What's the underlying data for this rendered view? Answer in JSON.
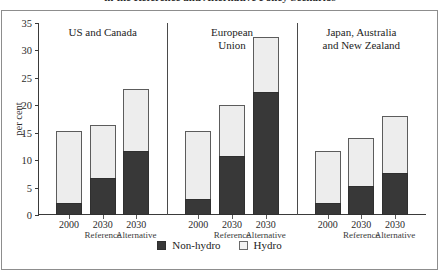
{
  "title": "in the Reference and Alternative Policy Scenarios",
  "axis": {
    "ylabel": "per cent",
    "yticks": [
      "0",
      "5",
      "10",
      "15",
      "20",
      "25",
      "30",
      "35"
    ],
    "ymin": 0,
    "ymax": 35
  },
  "legend": [
    {
      "label": "Non-hydro",
      "color": "#383838",
      "key": "nonhydro"
    },
    {
      "label": "Hydro",
      "color": "#f3f3f3",
      "key": "hydro"
    }
  ],
  "xticks": {
    "years": [
      "2000",
      "2030",
      "2030"
    ],
    "subs": [
      "",
      "Reference",
      "Alternative"
    ]
  },
  "chart_data": {
    "type": "bar",
    "title": "in the Reference and Alternative Policy Scenarios",
    "xlabel": "",
    "ylabel": "per cent",
    "ylim": [
      0,
      35
    ],
    "ytick_step": 5,
    "grid": false,
    "stacked": true,
    "legend_position": "bottom",
    "panels": [
      {
        "name": "US and Canada",
        "categories": [
          "2000",
          "2030 Reference",
          "2030 Alternative"
        ],
        "series": [
          {
            "name": "Non-hydro",
            "values": [
              2.2,
              6.8,
              11.6
            ]
          },
          {
            "name": "Hydro",
            "values": [
              13.1,
              9.6,
              11.4
            ]
          }
        ],
        "totals": [
          15.3,
          16.4,
          23.0
        ]
      },
      {
        "name": "European Union",
        "categories": [
          "2000",
          "2030 Reference",
          "2030 Alternative"
        ],
        "series": [
          {
            "name": "Non-hydro",
            "values": [
              3.0,
              10.7,
              22.4
            ]
          },
          {
            "name": "Hydro",
            "values": [
              12.3,
              9.4,
              10.0
            ]
          }
        ],
        "totals": [
          15.3,
          20.1,
          32.4
        ]
      },
      {
        "name": "Japan, Australia and New Zealand",
        "categories": [
          "2000",
          "2030 Reference",
          "2030 Alternative"
        ],
        "series": [
          {
            "name": "Non-hydro",
            "values": [
              2.1,
              5.2,
              7.6
            ]
          },
          {
            "name": "Hydro",
            "values": [
              9.6,
              8.9,
              10.5
            ]
          }
        ],
        "totals": [
          11.7,
          14.1,
          18.1
        ]
      }
    ]
  },
  "panel_titles": [
    "US and Canada",
    "European\nUnion",
    "Japan, Australia\nand New Zealand"
  ]
}
